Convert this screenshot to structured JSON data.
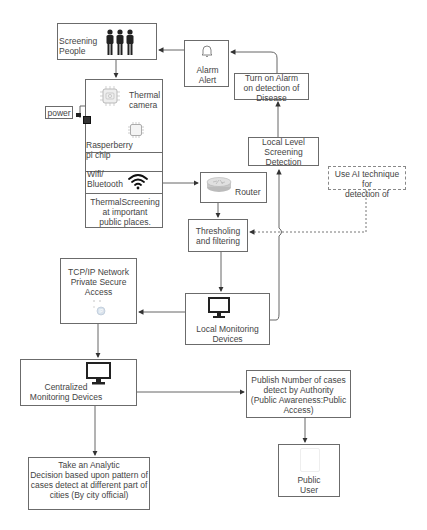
{
  "diagram": {
    "nodes": {
      "screening_people": {
        "label": "Screening\nPeople",
        "icon": "people-icon"
      },
      "alarm_alert": {
        "label": "Alarm\nAlert",
        "icon": "bell-icon"
      },
      "thermal_unit": {
        "camera_label": "Thermal\ncamera",
        "chip_label": "Rasperberry\npi chip",
        "wifi_label": "Wifi/\nBluetooth",
        "caption": "ThermalScreening\nat important\npublic places."
      },
      "power": {
        "label": "power"
      },
      "turn_on_alarm": {
        "label": "Turn on Alarm\non detection of\nDisease"
      },
      "local_level_screening": {
        "label": "Local Level\nScreening\nDetection"
      },
      "ai_technique": {
        "label": "Use AI technique for\ndetection of"
      },
      "router": {
        "label": "Router",
        "icon": "router-icon"
      },
      "thresholding": {
        "label": "Thresholing\nand filtering"
      },
      "local_monitoring": {
        "label": "Local Monitoring\nDevices",
        "icon": "monitor-icon"
      },
      "tcpip_network": {
        "label": "TCP/IP Network\nPrivate Secure\nAccess",
        "icon": "ip-icon"
      },
      "centralized_monitoring": {
        "label": "Centralized\nMonitoring Devices",
        "icon": "monitor-icon"
      },
      "publish_cases": {
        "label": "Publish Number of cases\ndetect by  Authority\n(Public Awareness:Public\nAccess)"
      },
      "public_user": {
        "label": "Public\nUser",
        "icon": "phone-icon"
      },
      "analytic_decision": {
        "label": "Take an Analytic\nDecision based upon pattern of\ncases detect at different part of\ncities (By city official)"
      }
    },
    "edges": [
      {
        "from": "screening_people",
        "to": "thermal_unit",
        "style": "solid"
      },
      {
        "from": "alarm_alert",
        "to": "screening_people",
        "style": "solid"
      },
      {
        "from": "turn_on_alarm",
        "to": "alarm_alert",
        "style": "solid"
      },
      {
        "from": "local_level_screening",
        "to": "turn_on_alarm",
        "style": "solid"
      },
      {
        "from": "local_monitoring",
        "to": "local_level_screening",
        "style": "solid"
      },
      {
        "from": "thermal_unit",
        "to": "router",
        "style": "solid"
      },
      {
        "from": "router",
        "to": "thresholding",
        "style": "solid"
      },
      {
        "from": "ai_technique",
        "to": "thresholding",
        "style": "dashed"
      },
      {
        "from": "thresholding",
        "to": "local_monitoring",
        "style": "solid"
      },
      {
        "from": "local_monitoring",
        "to": "tcpip_network",
        "style": "solid"
      },
      {
        "from": "tcpip_network",
        "to": "centralized_monitoring",
        "style": "solid"
      },
      {
        "from": "centralized_monitoring",
        "to": "publish_cases",
        "style": "solid"
      },
      {
        "from": "centralized_monitoring",
        "to": "analytic_decision",
        "style": "solid"
      },
      {
        "from": "publish_cases",
        "to": "public_user",
        "style": "solid"
      }
    ]
  },
  "colors": {
    "stroke": "#6b6b6b",
    "text": "#444444",
    "icon_dark": "#2b2b2b"
  }
}
